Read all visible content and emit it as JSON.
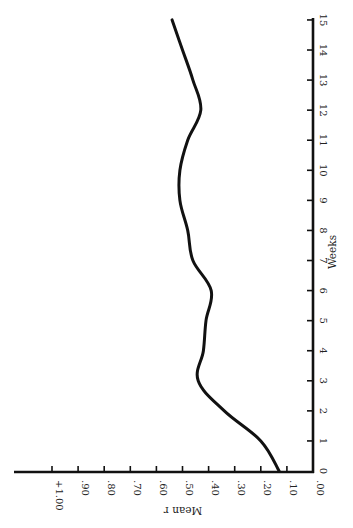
{
  "chart_data": {
    "type": "line",
    "title": "",
    "orientation_note": "figure printed rotated 90 degrees clockwise",
    "xlabel": "Weeks",
    "ylabel": "Mean r",
    "x": [
      0,
      1,
      2,
      3,
      4,
      5,
      6,
      7,
      8,
      9,
      10,
      11,
      12,
      13,
      14,
      15
    ],
    "values": [
      0.13,
      0.2,
      0.34,
      0.44,
      0.42,
      0.41,
      0.39,
      0.46,
      0.48,
      0.51,
      0.51,
      0.48,
      0.43,
      0.46,
      0.5,
      0.54
    ],
    "xlim": [
      0,
      15
    ],
    "ylim": [
      0,
      1.0
    ],
    "x_ticks": [
      "0",
      "1",
      "2",
      "3",
      "4",
      "5",
      "6",
      "7",
      "8",
      "9",
      "10",
      "11",
      "12",
      "13",
      "14",
      "15"
    ],
    "y_ticks": [
      ".00",
      ".10",
      ".20",
      ".30",
      ".40",
      ".50",
      ".60",
      ".70",
      ".80",
      ".90",
      "+1.00"
    ],
    "grid": false,
    "legend": null
  },
  "labels": {
    "x_axis_title": "Weeks",
    "y_axis_title": "Mean r"
  }
}
